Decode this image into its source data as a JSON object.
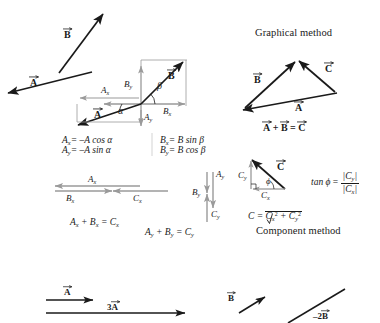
{
  "figure": {
    "ink_color": "#1a1a1a",
    "gray_color": "#9a9a9a",
    "background": "#ffffff"
  },
  "panel_left": {
    "free_vectors": {
      "vector_b_label": "B",
      "vector_a_label": "A"
    },
    "axes_diagram": {
      "vector_b_label": "B",
      "vector_a_label": "A",
      "angle_beta": "β",
      "angle_alpha": "α",
      "comp_ax": "A",
      "comp_ax_sub": "x",
      "comp_ay": "A",
      "comp_ay_sub": "y",
      "comp_bx": "B",
      "comp_bx_sub": "x",
      "comp_by": "B",
      "comp_by_sub": "y"
    },
    "equations_a": {
      "line1_lhs": "A",
      "line1_lhs_sub": "x",
      "line1_rhs": "= –A cos ",
      "line1_angle": "α",
      "line2_lhs": "A",
      "line2_lhs_sub": "y",
      "line2_rhs": "= –A sin ",
      "line2_angle": "α"
    },
    "equations_b": {
      "line1_lhs": "B",
      "line1_lhs_sub": "x",
      "line1_rhs": "= B sin ",
      "line1_angle": "β",
      "line2_lhs": "B",
      "line2_lhs_sub": "y",
      "line2_rhs": "= B cos ",
      "line2_angle": "β"
    }
  },
  "panel_components": {
    "x_group": {
      "label_ax": "A",
      "label_ax_sub": "x",
      "label_bx": "B",
      "label_bx_sub": "x",
      "label_cx": "C",
      "label_cx_sub": "x",
      "equation": "A",
      "equation_sub1": "x",
      "equation_mid": " + B",
      "equation_sub2": "x",
      "equation_end": " = C",
      "equation_sub3": "x"
    },
    "y_group": {
      "label_ay": "A",
      "label_ay_sub": "y",
      "label_by": "B",
      "label_by_sub": "y",
      "label_cy": "C",
      "label_cy_sub": "y",
      "equation": "A",
      "equation_sub1": "y",
      "equation_mid": " + B",
      "equation_sub2": "y",
      "equation_end": " = C",
      "equation_sub3": "y"
    }
  },
  "panel_graphical": {
    "heading": "Graphical method",
    "vector_b_label": "B",
    "vector_c_label": "C",
    "vector_a_label": "A",
    "equation_a": "A",
    "equation_plus": " + ",
    "equation_b": "B",
    "equation_eq": " = ",
    "equation_c": "C"
  },
  "panel_component_method": {
    "heading": "Component method",
    "vector_c_label": "C",
    "label_cy": "C",
    "label_cy_sub": "y",
    "label_cx": "C",
    "label_cx_sub": "x",
    "angle_phi": "ϕ",
    "tan_formula": {
      "lhs": "tan ",
      "lhs_angle": "ϕ",
      "eq": " = ",
      "numerator": "|C",
      "numerator_sub": "y",
      "numerator_end": "|",
      "denominator": "|C",
      "denominator_sub": "x",
      "denominator_end": "|"
    },
    "magnitude_formula": {
      "lhs": "C = ",
      "radicand_1": "C",
      "radicand_1_sub": "x",
      "radicand_1_sup": "2",
      "plus": " + ",
      "radicand_2": "C",
      "radicand_2_sub": "y",
      "radicand_2_sup": "2"
    }
  },
  "panel_scaling": {
    "vector_a_label": "A",
    "scaled_a_label": "3",
    "scaled_a_vector": "A",
    "vector_b_label": "B",
    "scaled_b_label": "–2",
    "scaled_b_vector": "B"
  }
}
